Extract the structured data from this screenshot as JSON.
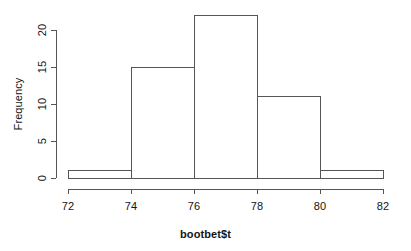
{
  "chart_data": {
    "type": "bar",
    "subtype": "histogram",
    "title": "",
    "xlabel": "bootbet$t",
    "ylabel": "Frequency",
    "bin_edges": [
      72,
      74,
      76,
      78,
      80,
      82
    ],
    "categories": [
      "72-74",
      "74-76",
      "76-78",
      "78-80",
      "80-82"
    ],
    "values": [
      1,
      15,
      22,
      11,
      1
    ],
    "bin_width": 2,
    "xlim": [
      72,
      82
    ],
    "ylim": [
      0,
      22
    ],
    "y_axis_drawn_max": 20,
    "xticks": [
      72,
      74,
      76,
      78,
      80,
      82
    ],
    "xtick_labels": [
      "72",
      "74",
      "76",
      "78",
      "80",
      "82"
    ],
    "yticks": [
      0,
      5,
      10,
      15,
      20
    ],
    "ytick_labels": [
      "0",
      "5",
      "10",
      "15",
      "20"
    ],
    "grid": false,
    "legend": false,
    "bar_fill_color": "#ffffff",
    "bar_edge_color": "#555555",
    "axis_color": "#555555",
    "background_color": "#ffffff",
    "text_color": "#141414"
  },
  "plot": {
    "style": "r-base-graphics",
    "axis_line_width": 1
  }
}
